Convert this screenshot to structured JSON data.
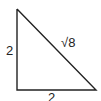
{
  "diagram": {
    "type": "right-triangle",
    "stroke_color": "#222222",
    "labels": {
      "left_side": "2",
      "bottom_side": "2",
      "hypotenuse": "√8"
    }
  }
}
